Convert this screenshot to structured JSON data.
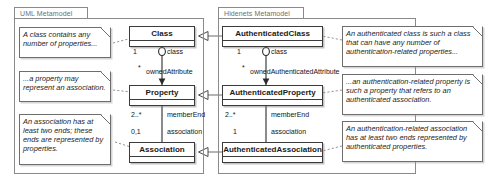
{
  "diagram": {
    "packages": [
      {
        "id": "uml",
        "label": "UML Metamodel"
      },
      {
        "id": "hidenets",
        "label": "Hidenets Metamodel"
      }
    ]
  },
  "uml": {
    "package_label": "UML Metamodel",
    "classes": [
      {
        "name": "Class"
      },
      {
        "name": "Property"
      },
      {
        "name": "Association"
      }
    ],
    "associations": [
      {
        "role_source": "class",
        "mult_source": "1",
        "role_target": "ownedAttribute",
        "mult_target": "*"
      },
      {
        "role_source": "memberEnd",
        "mult_source": "2..*",
        "role_target": "association",
        "mult_target": "0,1"
      }
    ],
    "edge_labels": {
      "class": "class",
      "owned_attribute": "ownedAttribute",
      "member_end": "memberEnd",
      "association": "association"
    },
    "multiplicities": {
      "class": "1",
      "owned_attribute": "*",
      "member_end": "2..*",
      "association": "0,1"
    },
    "notes": [
      {
        "text": "A class contains any number of properties..."
      },
      {
        "text": "...a property may represent an association."
      },
      {
        "text": "An association has at least two ends; these ends are represented by properties."
      }
    ]
  },
  "hidenets": {
    "package_label": "Hidenets Metamodel",
    "classes": [
      {
        "name": "AuthenticatedClass"
      },
      {
        "name": "AuthenticatedProperty"
      },
      {
        "name": "AuthenticatedAssociation"
      }
    ],
    "edge_labels": {
      "class": "class",
      "owned_attribute": "ownedAuthenticatedAttribute",
      "member_end": "memberEnd",
      "association": "association"
    },
    "multiplicities": {
      "class": "1",
      "owned_attribute": "*",
      "member_end": "2..*",
      "association": "1"
    },
    "notes": [
      {
        "text": "An authenticated class is such a class that can have any number of authentication-related properties..."
      },
      {
        "text": "...an authentication-related property is such a property that refers to an authenticated association."
      },
      {
        "text": "An authentication-related association has at least two ends represented by authenticated properties."
      }
    ]
  },
  "colors": {
    "line": "#3b3b3b",
    "frame": "#8a8a8a",
    "note_border": "#6e6e6e",
    "text": "#1a1a1a",
    "tab_text": "#6f6f6f",
    "background": "#ffffff"
  }
}
